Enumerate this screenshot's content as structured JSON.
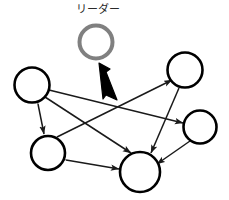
{
  "figure": {
    "type": "diagram",
    "subtype": "leader-follower-network",
    "width": 229,
    "height": 200,
    "background_color": "#ffffff"
  },
  "labels": {
    "leader": "リーダー"
  },
  "colors": {
    "leader_node_stroke": "#808080",
    "agent_node_stroke": "#000000",
    "node_fill": "#ffffff",
    "edge_stroke": "#1a1a1a",
    "pointer_arrow_fill": "#000000",
    "label_text": "#2a2a2a"
  },
  "leader_node": {
    "name": "leader-node",
    "cx": 96,
    "cy": 42,
    "r": 16.5,
    "stroke_width": 4,
    "stroke_color": "#808080",
    "fill": "#ffffff"
  },
  "pointer_arrow": {
    "name": "leader-pointer-arrow",
    "from": [
      99,
      63
    ],
    "to": [
      115,
      101
    ],
    "style": "thick-tapered",
    "fill": "#000000"
  },
  "nodes": [
    {
      "id": "n1",
      "name": "agent-node-top-left",
      "cx": 32,
      "cy": 85,
      "r": 17.5,
      "stroke_width": 2.6
    },
    {
      "id": "n2",
      "name": "agent-node-bottom-left",
      "cx": 48,
      "cy": 153,
      "r": 17.0,
      "stroke_width": 2.6
    },
    {
      "id": "n3",
      "name": "agent-node-bottom-center",
      "cx": 140,
      "cy": 172,
      "r": 20.0,
      "stroke_width": 2.6
    },
    {
      "id": "n4",
      "name": "agent-node-top-right",
      "cx": 185,
      "cy": 70,
      "r": 17.5,
      "stroke_width": 2.6
    },
    {
      "id": "n5",
      "name": "agent-node-right",
      "cx": 200,
      "cy": 127,
      "r": 16.5,
      "stroke_width": 2.6
    }
  ],
  "edges": [
    {
      "id": "e1",
      "name": "edge-top-left-bottom-left",
      "from": "n1",
      "to": "n2",
      "arrows": "both"
    },
    {
      "id": "e2",
      "name": "edge-bottom-left-bottom-center",
      "from": "n2",
      "to": "n3",
      "arrows": "both"
    },
    {
      "id": "e3",
      "name": "edge-top-right-bottom-center",
      "from": "n4",
      "to": "n3",
      "arrows": "both"
    },
    {
      "id": "e4",
      "name": "edge-top-left-right",
      "from": "n1",
      "to": "n5",
      "arrows": "both"
    },
    {
      "id": "e5",
      "name": "edge-top-left-bottom-center",
      "from": "n1",
      "to": "n3",
      "arrows": "both"
    },
    {
      "id": "e6",
      "name": "edge-bottom-left-top-right",
      "from": "n2",
      "to": "n4",
      "arrows": "both"
    },
    {
      "id": "e7",
      "name": "edge-right-bottom-center",
      "from": "n5",
      "to": "n3",
      "arrows": "to"
    }
  ]
}
